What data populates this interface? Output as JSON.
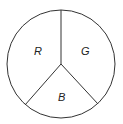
{
  "diagram": {
    "type": "circle-divided-into-three-sectors",
    "stroke_color": "#333333",
    "background": "#ffffff",
    "sectors": [
      {
        "label": "R"
      },
      {
        "label": "G"
      },
      {
        "label": "B"
      }
    ]
  }
}
